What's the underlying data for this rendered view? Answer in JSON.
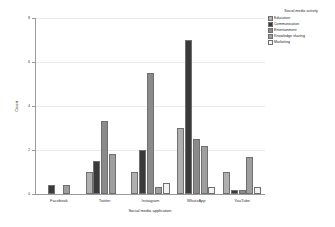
{
  "chart_data": {
    "type": "bar",
    "title": "",
    "xlabel": "Social media application",
    "ylabel": "Count",
    "categories": [
      "Facebook",
      "Twitter",
      "Instagram",
      "WhatsApp",
      "YouTube"
    ],
    "series": [
      {
        "name": "Education",
        "color": "#b0b0b0",
        "values": [
          0,
          1,
          1,
          3,
          1
        ]
      },
      {
        "name": "Communication",
        "color": "#3a3a3a",
        "values": [
          0.4,
          1.5,
          2,
          7,
          0.2
        ]
      },
      {
        "name": "Entertainment",
        "color": "#8a8a8a",
        "values": [
          0,
          3.3,
          5.5,
          2.5,
          0.2
        ]
      },
      {
        "name": "Knowledge sharing",
        "color": "#9e9e9e",
        "values": [
          0.4,
          1.8,
          0.3,
          2.2,
          1.7
        ]
      },
      {
        "name": "Marketing",
        "color": "#f2f2f2",
        "values": [
          0,
          0,
          0.5,
          0.3,
          0.3
        ]
      }
    ],
    "ylim": [
      0,
      8
    ],
    "yticks": [
      "0",
      "2",
      "4",
      "6",
      "8"
    ],
    "ytick_values": [
      0,
      2,
      4,
      6,
      8
    ],
    "grid": true,
    "legend": {
      "title": "Social media activity",
      "position": "top-right"
    }
  }
}
